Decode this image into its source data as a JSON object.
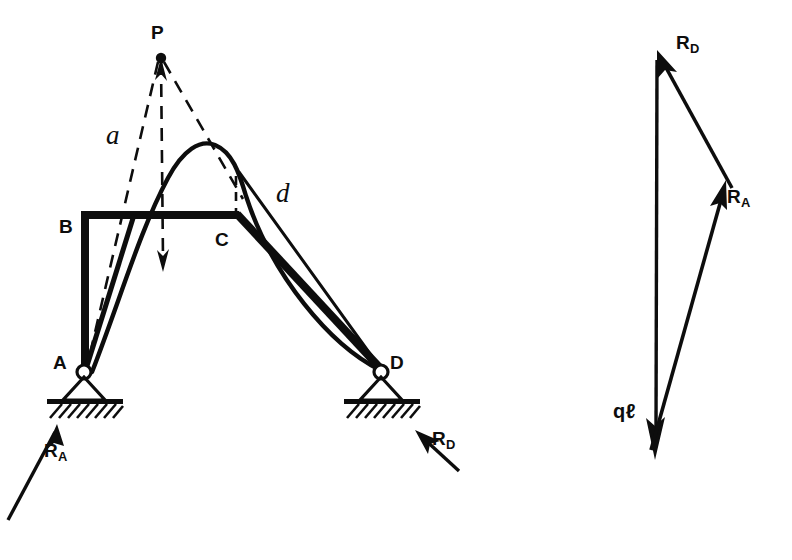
{
  "figure": {
    "stroke_color": "#0d0d0d",
    "background": "#ffffff"
  },
  "structure": {
    "nodes": [
      {
        "id": "P",
        "label": "P",
        "x": 160,
        "y": 57,
        "label_x": 151,
        "label_y": 22
      },
      {
        "id": "B",
        "label": "B",
        "x": 85,
        "y": 213,
        "label_x": 59,
        "label_y": 216
      },
      {
        "id": "C",
        "label": "C",
        "x": 236,
        "y": 213,
        "label_x": 215,
        "label_y": 229
      },
      {
        "id": "A",
        "label": "A",
        "x": 84,
        "y": 370,
        "label_x": 53,
        "label_y": 352
      },
      {
        "id": "D",
        "label": "D",
        "x": 381,
        "y": 370,
        "label_x": 390,
        "label_y": 352
      }
    ],
    "dimensions": [
      {
        "id": "a",
        "label": "a",
        "x": 106,
        "y": 120
      },
      {
        "id": "d",
        "label": "d",
        "x": 276,
        "y": 178
      }
    ],
    "reactions": [
      {
        "id": "RA",
        "label": "R",
        "subscript": "A",
        "x": 44,
        "y": 440
      },
      {
        "id": "RD",
        "label": "R",
        "subscript": "D",
        "x": 432,
        "y": 428
      }
    ]
  },
  "force_triangle": {
    "vectors": [
      {
        "id": "RD",
        "label": "R",
        "subscript": "D",
        "x": 676,
        "y": 32
      },
      {
        "id": "RA",
        "label": "R",
        "subscript": "A",
        "x": 727,
        "y": 186
      },
      {
        "id": "ql",
        "label": "qℓ",
        "subscript": "",
        "x": 613,
        "y": 402
      }
    ]
  }
}
